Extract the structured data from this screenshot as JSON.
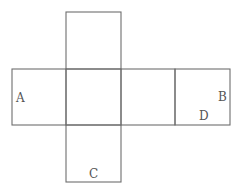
{
  "diagram": {
    "type": "cube-net",
    "faces": [
      {
        "id": "top",
        "label": ""
      },
      {
        "id": "left",
        "label": "A"
      },
      {
        "id": "center",
        "label": ""
      },
      {
        "id": "right-middle",
        "label": ""
      },
      {
        "id": "far-right",
        "label": "B"
      },
      {
        "id": "bottom",
        "label": "C"
      }
    ],
    "labels": {
      "a": "A",
      "b": "B",
      "c": "C",
      "d": "D"
    },
    "line_color": "#6e6e6e"
  }
}
